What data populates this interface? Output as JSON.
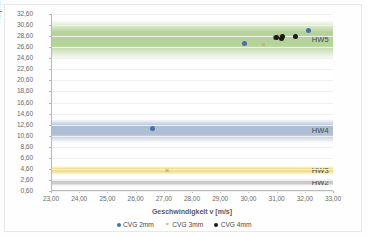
{
  "chart_data": {
    "type": "scatter",
    "title": "",
    "xlabel": "Geschwindigkeit v [m/s]",
    "ylabel": "Aufprallenergie Eh[J]",
    "xlim": [
      23.0,
      33.0
    ],
    "ylim": [
      0.6,
      32.6
    ],
    "xticks": [
      "23,00",
      "24,00",
      "25,00",
      "26,00",
      "27,00",
      "28,00",
      "29,00",
      "30,00",
      "31,00",
      "32,00",
      "33,00"
    ],
    "yticks": [
      "32,60",
      "30,60",
      "28,60",
      "26,60",
      "24,60",
      "22,60",
      "20,60",
      "18,60",
      "16,60",
      "14,60",
      "12,60",
      "10,60",
      "8,60",
      "6,60",
      "4,60",
      "2,60",
      "0,60"
    ],
    "grid": true,
    "legend_position": "bottom",
    "series": [
      {
        "name": "CVG 2mm",
        "marker": "circle",
        "color": "#4472a8",
        "points": [
          {
            "x": 29.82,
            "y": 27.3
          },
          {
            "x": 30.93,
            "y": 28.35
          },
          {
            "x": 32.1,
            "y": 29.55
          },
          {
            "x": 26.58,
            "y": 11.9
          }
        ]
      },
      {
        "name": "CVG 3mm",
        "marker": "x",
        "color": "#d9a05b",
        "points": [
          {
            "x": 30.5,
            "y": 27.1
          },
          {
            "x": 31.07,
            "y": 28.75
          },
          {
            "x": 27.08,
            "y": 4.3
          }
        ]
      },
      {
        "name": "CVG 4mm",
        "marker": "circle",
        "color": "#1a1a1a",
        "points": [
          {
            "x": 30.96,
            "y": 28.4
          },
          {
            "x": 31.13,
            "y": 28.1
          },
          {
            "x": 31.18,
            "y": 28.6
          },
          {
            "x": 31.62,
            "y": 28.45
          }
        ]
      }
    ],
    "bands": [
      {
        "label": "HW5",
        "color": "#8ab75e",
        "y_top": 31.6,
        "y_bottom": 24.3
      },
      {
        "label": "HW4",
        "color": "#7a95bb",
        "y_top": 13.6,
        "y_bottom": 9.3
      },
      {
        "label": "HW3",
        "color": "#e8c94a",
        "y_top": 5.1,
        "y_bottom": 3.45
      },
      {
        "label": "HW2",
        "color": "#a8a8a8",
        "y_top": 2.7,
        "y_bottom": 1.45
      }
    ]
  }
}
